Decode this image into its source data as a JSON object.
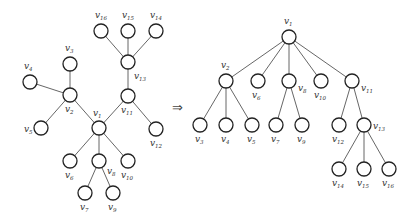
{
  "arrow_symbol": "⇒",
  "node_radius": 7,
  "label_prefix": "v",
  "left_graph": {
    "name": "unrooted tree",
    "nodes": [
      {
        "id": "1",
        "x": 99,
        "y": 128,
        "lx": 93,
        "ly": 116
      },
      {
        "id": "2",
        "x": 70,
        "y": 95,
        "lx": 65,
        "ly": 112
      },
      {
        "id": "3",
        "x": 70,
        "y": 64,
        "lx": 65,
        "ly": 51
      },
      {
        "id": "4",
        "x": 30,
        "y": 82,
        "lx": 24,
        "ly": 69
      },
      {
        "id": "5",
        "x": 41,
        "y": 128,
        "lx": 24,
        "ly": 132
      },
      {
        "id": "6",
        "x": 70,
        "y": 161,
        "lx": 65,
        "ly": 178
      },
      {
        "id": "7",
        "x": 85,
        "y": 193,
        "lx": 80,
        "ly": 210
      },
      {
        "id": "8",
        "x": 99,
        "y": 161,
        "lx": 107,
        "ly": 174
      },
      {
        "id": "9",
        "x": 113,
        "y": 193,
        "lx": 108,
        "ly": 210
      },
      {
        "id": "10",
        "x": 128,
        "y": 161,
        "lx": 121,
        "ly": 178
      },
      {
        "id": "11",
        "x": 128,
        "y": 96,
        "lx": 121,
        "ly": 113
      },
      {
        "id": "12",
        "x": 156,
        "y": 129,
        "lx": 150,
        "ly": 146
      },
      {
        "id": "13",
        "x": 128,
        "y": 62,
        "lx": 134,
        "ly": 79
      },
      {
        "id": "14",
        "x": 156,
        "y": 31,
        "lx": 150,
        "ly": 18
      },
      {
        "id": "15",
        "x": 128,
        "y": 31,
        "lx": 122,
        "ly": 18
      },
      {
        "id": "16",
        "x": 101,
        "y": 31,
        "lx": 95,
        "ly": 18
      }
    ],
    "edges": [
      [
        "1",
        "2"
      ],
      [
        "1",
        "11"
      ],
      [
        "1",
        "6"
      ],
      [
        "1",
        "8"
      ],
      [
        "1",
        "10"
      ],
      [
        "2",
        "3"
      ],
      [
        "2",
        "4"
      ],
      [
        "2",
        "5"
      ],
      [
        "8",
        "7"
      ],
      [
        "8",
        "9"
      ],
      [
        "11",
        "12"
      ],
      [
        "11",
        "13"
      ],
      [
        "13",
        "14"
      ],
      [
        "13",
        "15"
      ],
      [
        "13",
        "16"
      ]
    ]
  },
  "right_graph": {
    "name": "rooted tree",
    "root": "1",
    "nodes": [
      {
        "id": "1",
        "x": 289,
        "y": 37,
        "lx": 284,
        "ly": 24
      },
      {
        "id": "2",
        "x": 226,
        "y": 81,
        "lx": 221,
        "ly": 68
      },
      {
        "id": "6",
        "x": 258,
        "y": 81,
        "lx": 252,
        "ly": 98
      },
      {
        "id": "8",
        "x": 289,
        "y": 81,
        "lx": 298,
        "ly": 91
      },
      {
        "id": "10",
        "x": 321,
        "y": 81,
        "lx": 314,
        "ly": 98
      },
      {
        "id": "11",
        "x": 352,
        "y": 81,
        "lx": 361,
        "ly": 91
      },
      {
        "id": "3",
        "x": 200,
        "y": 125,
        "lx": 195,
        "ly": 142
      },
      {
        "id": "4",
        "x": 226,
        "y": 125,
        "lx": 221,
        "ly": 142
      },
      {
        "id": "5",
        "x": 252,
        "y": 125,
        "lx": 247,
        "ly": 142
      },
      {
        "id": "7",
        "x": 276,
        "y": 125,
        "lx": 271,
        "ly": 142
      },
      {
        "id": "9",
        "x": 302,
        "y": 125,
        "lx": 297,
        "ly": 142
      },
      {
        "id": "12",
        "x": 339,
        "y": 125,
        "lx": 332,
        "ly": 142
      },
      {
        "id": "13",
        "x": 364,
        "y": 125,
        "lx": 373,
        "ly": 129
      },
      {
        "id": "14",
        "x": 339,
        "y": 169,
        "lx": 332,
        "ly": 186
      },
      {
        "id": "15",
        "x": 364,
        "y": 169,
        "lx": 357,
        "ly": 186
      },
      {
        "id": "16",
        "x": 389,
        "y": 169,
        "lx": 382,
        "ly": 186
      }
    ],
    "edges": [
      [
        "1",
        "2"
      ],
      [
        "1",
        "6"
      ],
      [
        "1",
        "8"
      ],
      [
        "1",
        "10"
      ],
      [
        "1",
        "11"
      ],
      [
        "2",
        "3"
      ],
      [
        "2",
        "4"
      ],
      [
        "2",
        "5"
      ],
      [
        "8",
        "7"
      ],
      [
        "8",
        "9"
      ],
      [
        "11",
        "12"
      ],
      [
        "11",
        "13"
      ],
      [
        "13",
        "14"
      ],
      [
        "13",
        "15"
      ],
      [
        "13",
        "16"
      ]
    ]
  },
  "arrow": {
    "x": 172,
    "y": 112
  }
}
